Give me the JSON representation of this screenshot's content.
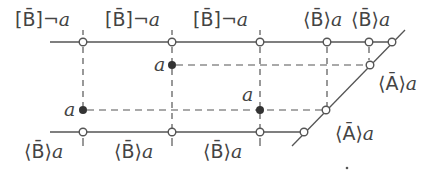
{
  "diagram": {
    "top_labels": [
      {
        "modal": "[B̄]",
        "formula": "¬a"
      },
      {
        "modal": "[B̄]",
        "formula": "¬a"
      },
      {
        "modal": "[B̄]",
        "formula": "¬a"
      },
      {
        "modal": "⟨B̄⟩",
        "formula": "a"
      },
      {
        "modal": "⟨B̄⟩",
        "formula": "a"
      }
    ],
    "bottom_labels": [
      {
        "modal": "⟨B̄⟩",
        "formula": "a"
      },
      {
        "modal": "⟨B̄⟩",
        "formula": "a"
      },
      {
        "modal": "⟨B̄⟩",
        "formula": "a"
      }
    ],
    "right_labels": [
      {
        "modal": "⟨Ā⟩",
        "formula": "a"
      },
      {
        "modal": "⟨Ā⟩",
        "formula": "a"
      }
    ],
    "point_labels": [
      "a",
      "a",
      "a"
    ],
    "colors": {
      "line": "#555555",
      "text": "#444444",
      "background": "#ffffff"
    }
  }
}
